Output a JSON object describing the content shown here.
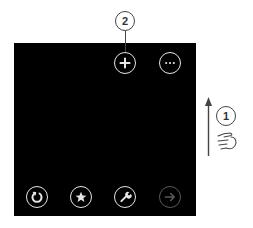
{
  "app_bar": {
    "top_buttons": [
      {
        "name": "add",
        "icon": "plus-icon",
        "enabled": true
      },
      {
        "name": "more",
        "icon": "ellipsis-icon",
        "enabled": true
      }
    ],
    "bottom_buttons": [
      {
        "name": "refresh",
        "icon": "refresh-icon",
        "enabled": true
      },
      {
        "name": "favorites",
        "icon": "star-icon",
        "enabled": true
      },
      {
        "name": "tools",
        "icon": "wrench-icon",
        "enabled": true
      },
      {
        "name": "forward",
        "icon": "forward-arrow-icon",
        "enabled": false
      }
    ]
  },
  "annotations": {
    "callout_1": "1",
    "callout_2": "2",
    "gesture": "swipe-up",
    "gesture_icon": "pointing-hand-icon"
  },
  "colors": {
    "screen_bg": "#000000",
    "icon_enabled": "#e6e6e6",
    "icon_disabled": "#5a5a5a",
    "annotation": "#444444"
  }
}
